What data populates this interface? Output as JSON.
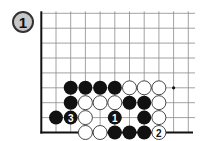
{
  "diagram": {
    "problem_number": "1",
    "board": {
      "grid_origin_x": 41.3,
      "grid_top_y": 13.3,
      "spacing_x": 14.7,
      "spacing_y": 14.9,
      "columns_visible": 11,
      "rows_visible": 9,
      "edges": [
        "left",
        "bottom"
      ],
      "line_extent_right": 195
    },
    "stones": [
      {
        "color": "black",
        "col": 2,
        "row": 5
      },
      {
        "color": "black",
        "col": 3,
        "row": 5
      },
      {
        "color": "black",
        "col": 4,
        "row": 5
      },
      {
        "color": "black",
        "col": 5,
        "row": 5
      },
      {
        "color": "white",
        "col": 6,
        "row": 5
      },
      {
        "color": "white",
        "col": 7,
        "row": 5
      },
      {
        "color": "white",
        "col": 8,
        "row": 5
      },
      {
        "color": "black",
        "col": 2,
        "row": 6
      },
      {
        "color": "white",
        "col": 3,
        "row": 6
      },
      {
        "color": "white",
        "col": 4,
        "row": 6
      },
      {
        "color": "white",
        "col": 5,
        "row": 6
      },
      {
        "color": "black",
        "col": 6,
        "row": 6
      },
      {
        "color": "black",
        "col": 7,
        "row": 6
      },
      {
        "color": "white",
        "col": 8,
        "row": 6
      },
      {
        "color": "black",
        "col": 1,
        "row": 7
      },
      {
        "color": "black",
        "col": 2,
        "row": 7,
        "label": "3"
      },
      {
        "color": "white",
        "col": 3,
        "row": 7
      },
      {
        "color": "black",
        "col": 5,
        "row": 7,
        "label": "1"
      },
      {
        "color": "black",
        "col": 7,
        "row": 7
      },
      {
        "color": "white",
        "col": 8,
        "row": 7
      },
      {
        "color": "white",
        "col": 3,
        "row": 8
      },
      {
        "color": "white",
        "col": 4,
        "row": 8
      },
      {
        "color": "black",
        "col": 5,
        "row": 8
      },
      {
        "color": "black",
        "col": 6,
        "row": 8
      },
      {
        "color": "black",
        "col": 7,
        "row": 8
      },
      {
        "color": "white",
        "col": 8,
        "row": 8,
        "label": "2"
      }
    ],
    "markers": [
      {
        "type": "dot",
        "col": 9,
        "row": 5
      }
    ],
    "colors": {
      "black_stone": "#111111",
      "white_stone": "#ffffff",
      "grid": "#8a8a8a",
      "edge": "#111111",
      "badge_fill": "#c8c8c8"
    }
  }
}
